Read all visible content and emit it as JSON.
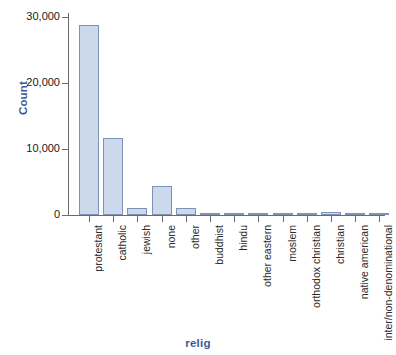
{
  "chart_data": {
    "type": "bar",
    "title": "",
    "xlabel": "relig",
    "ylabel": "Count",
    "categories": [
      "protestant",
      "catholic",
      "jewish",
      "none",
      "other",
      "buddhist",
      "hindu",
      "other eastern",
      "moslem",
      "orthodox christian",
      "christian",
      "native american",
      "inter/non-denominational"
    ],
    "values": [
      28800,
      11700,
      1100,
      4400,
      1000,
      200,
      150,
      100,
      250,
      200,
      400,
      250,
      300
    ],
    "ylim": [
      0,
      30000
    ],
    "yticks": [
      0,
      10000,
      20000,
      30000
    ],
    "ytick_labels": [
      "0",
      "10,000",
      "20,000",
      "30,000"
    ],
    "grid": false,
    "legend": null,
    "bar_fill_color": "#ccd9ec",
    "bar_edge_color": "#7f92b5",
    "axis_color": "#6c6c6c",
    "axis_title_color": "#3d5a97",
    "background_color": "#ffffff"
  }
}
